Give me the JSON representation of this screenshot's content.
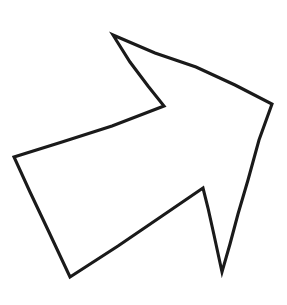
{
  "document": {
    "title": "Arrow Outline Drawing",
    "canvas": {
      "width": 287,
      "height": 305,
      "background_color": "#ffffff"
    }
  },
  "figure": {
    "name": "hand-drawn-arrow-outline",
    "style": {
      "stroke_color": "#1a1a1a",
      "fill_color": "#ffffff",
      "stroke_width": 3.1,
      "closed": true
    },
    "vertex_labels": [
      "arrowhead-top-tip",
      "arrowhead-right-tip",
      "tail-right-upper",
      "tail-right-spike-tip",
      "tail-inner-spike-top",
      "tail-bottom-left",
      "shaft-left-corner",
      "arrowhead-inner-notch"
    ],
    "vertices": [
      [
        113,
        35
      ],
      [
        272,
        104
      ],
      [
        238,
        214
      ],
      [
        222,
        272
      ],
      [
        203,
        188
      ],
      [
        70,
        277
      ],
      [
        14,
        157
      ],
      [
        164,
        106
      ]
    ],
    "path": "M 113 35 L 155 53 L 196 67 L 235 85 L 272 104 L 259 140 L 248 180 L 238 214 L 230 244 L 222 272 L 214 235 L 208 208 L 203 188 L 162 216 L 118 246 L 70 277 L 48 230 L 30 192 L 14 157 L 62 142 L 112 126 L 164 106 L 148 86 L 130 62 Z"
  }
}
